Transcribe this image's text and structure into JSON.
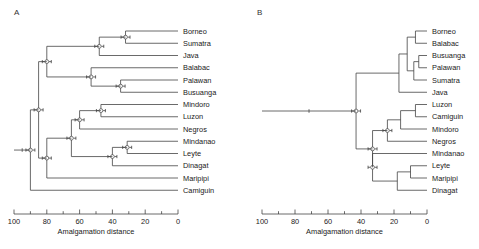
{
  "figure": {
    "panels": [
      "A",
      "B"
    ],
    "axis_title": "Amalgamation distance",
    "axis_ticks": [
      100,
      90,
      80,
      70,
      60,
      50,
      40,
      30,
      20,
      10,
      0
    ],
    "axis_major_labels": [
      "100",
      "80",
      "60",
      "40",
      "20",
      "0"
    ],
    "line_color": "#444444"
  },
  "chart_data": [
    {
      "type": "dendrogram",
      "title": "A",
      "xlabel": "Amalgamation distance",
      "ylabel": "",
      "xlim": [
        100,
        0
      ],
      "axis_reversed": true,
      "grid": false,
      "leaves": [
        "Borneo",
        "Sumatra",
        "Java",
        "Balabac",
        "Palawan",
        "Busuanga",
        "Mindoro",
        "Luzon",
        "Negros",
        "Mindanao",
        "Leyte",
        "Dinagat",
        "Maripipi",
        "Camiguin"
      ],
      "merges": [
        {
          "id": "n1",
          "children": [
            "Borneo",
            "Sumatra"
          ],
          "distance": 32
        },
        {
          "id": "n2",
          "children": [
            "n1",
            "Java"
          ],
          "distance": 48
        },
        {
          "id": "n3",
          "children": [
            "Palawan",
            "Busuanga"
          ],
          "distance": 35
        },
        {
          "id": "n4",
          "children": [
            "Balabac",
            "n3"
          ],
          "distance": 53
        },
        {
          "id": "n5",
          "children": [
            "n2",
            "n4"
          ],
          "distance": 80
        },
        {
          "id": "n6",
          "children": [
            "Mindoro",
            "Luzon"
          ],
          "distance": 47
        },
        {
          "id": "n7",
          "children": [
            "n6",
            "Negros"
          ],
          "distance": 60
        },
        {
          "id": "n8",
          "children": [
            "Mindanao",
            "Leyte"
          ],
          "distance": 31
        },
        {
          "id": "n9",
          "children": [
            "n8",
            "Dinagat"
          ],
          "distance": 40
        },
        {
          "id": "n10",
          "children": [
            "n7",
            "n9"
          ],
          "distance": 65
        },
        {
          "id": "n11",
          "children": [
            "n10",
            "Maripipi"
          ],
          "distance": 80
        },
        {
          "id": "n12",
          "children": [
            "n5",
            "n11"
          ],
          "distance": 85
        },
        {
          "id": "n13",
          "children": [
            "n12",
            "Camiguin"
          ],
          "distance": 90
        }
      ]
    },
    {
      "type": "dendrogram",
      "title": "B",
      "xlabel": "Amalgamation distance",
      "ylabel": "",
      "xlim": [
        100,
        0
      ],
      "axis_reversed": true,
      "grid": false,
      "leaves": [
        "Borneo",
        "Balabac",
        "Busuanga",
        "Palawan",
        "Sumatra",
        "Java",
        "Luzon",
        "Camiguin",
        "Mindoro",
        "Negros",
        "Mindanao",
        "Leyte",
        "Maripipi",
        "Dinagat"
      ],
      "merges": [
        {
          "id": "m1",
          "children": [
            "Borneo",
            "Balabac"
          ],
          "distance": 7
        },
        {
          "id": "m2",
          "children": [
            "Busuanga",
            "Palawan"
          ],
          "distance": 5
        },
        {
          "id": "m3",
          "children": [
            "m2",
            "Sumatra"
          ],
          "distance": 8
        },
        {
          "id": "m4",
          "children": [
            "m1",
            "m3"
          ],
          "distance": 12
        },
        {
          "id": "m5",
          "children": [
            "m4",
            "Java"
          ],
          "distance": 17
        },
        {
          "id": "m6",
          "children": [
            "Luzon",
            "Camiguin"
          ],
          "distance": 7
        },
        {
          "id": "m7",
          "children": [
            "m6",
            "Mindoro"
          ],
          "distance": 16
        },
        {
          "id": "m8",
          "children": [
            "m7",
            "Negros"
          ],
          "distance": 24
        },
        {
          "id": "m9",
          "children": [
            "Leyte",
            "Maripipi"
          ],
          "distance": 10
        },
        {
          "id": "m10",
          "children": [
            "m9",
            "Dinagat"
          ],
          "distance": 18
        },
        {
          "id": "m11",
          "children": [
            "Mindanao",
            "m10"
          ],
          "distance": 33
        },
        {
          "id": "m12",
          "children": [
            "m8",
            "m11"
          ],
          "distance": 33
        },
        {
          "id": "m13",
          "children": [
            "m5",
            "m12"
          ],
          "distance": 43
        }
      ]
    }
  ]
}
